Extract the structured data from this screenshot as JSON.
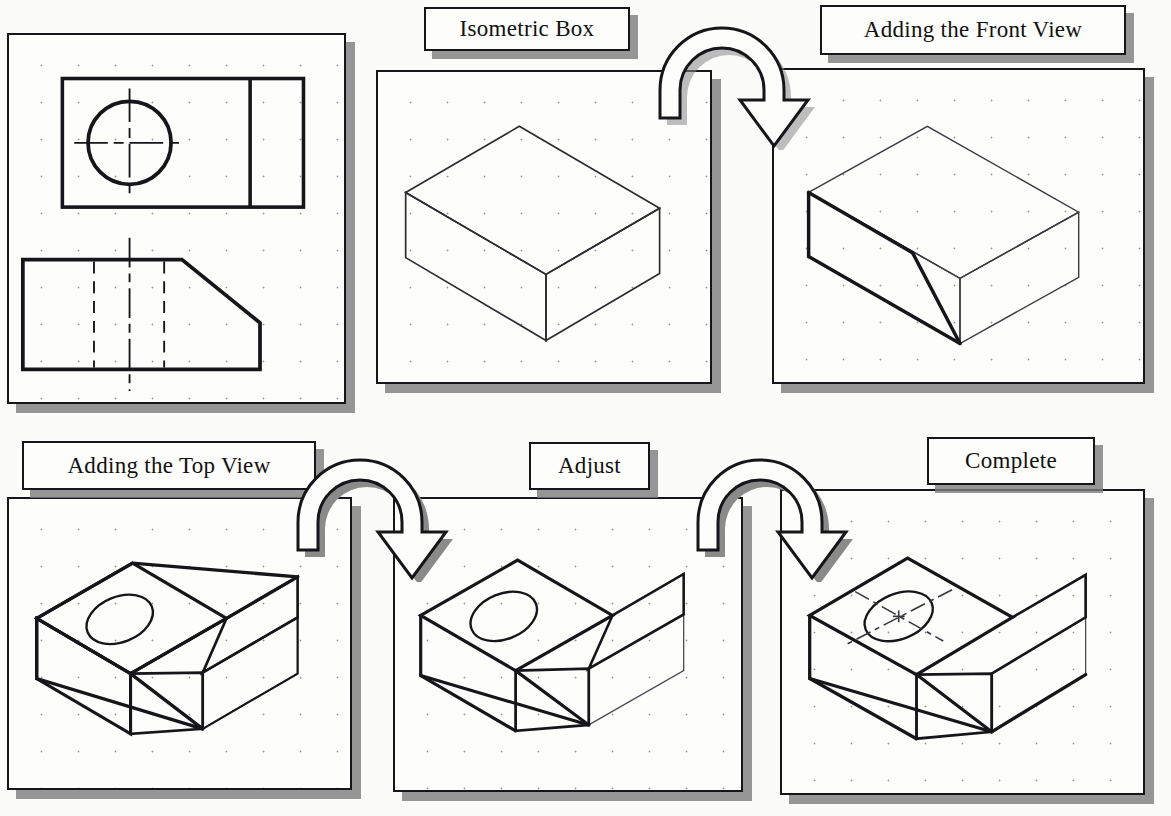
{
  "figure": {
    "kind": "isometric-drawing-tutorial"
  },
  "captions": [
    {
      "id": "isometric-box",
      "text": "Isometric Box",
      "x": 424,
      "y": 7,
      "w": 206,
      "h": 44,
      "font_size": 23
    },
    {
      "id": "front-view",
      "text": "Adding the Front View",
      "x": 820,
      "y": 5,
      "w": 306,
      "h": 50,
      "font_size": 23
    },
    {
      "id": "top-view",
      "text": "Adding the Top View",
      "x": 22,
      "y": 441,
      "w": 294,
      "h": 49,
      "font_size": 23
    },
    {
      "id": "adjust",
      "text": "Adjust",
      "x": 529,
      "y": 442,
      "w": 121,
      "h": 48,
      "font_size": 23
    },
    {
      "id": "complete",
      "text": "Complete",
      "x": 927,
      "y": 437,
      "w": 168,
      "h": 48,
      "font_size": 23
    }
  ],
  "panels": [
    {
      "id": "orthographic-views",
      "label": "Orthographic Views",
      "x": 7,
      "y": 33,
      "w": 339,
      "h": 371
    },
    {
      "id": "isometric-box",
      "label": "Isometric Box",
      "x": 376,
      "y": 70,
      "w": 336,
      "h": 314
    },
    {
      "id": "front-view",
      "label": "Adding the Front View",
      "x": 772,
      "y": 68,
      "w": 373,
      "h": 316
    },
    {
      "id": "top-view",
      "label": "Adding the Top View",
      "x": 7,
      "y": 497,
      "w": 345,
      "h": 293
    },
    {
      "id": "adjust",
      "label": "Adjust",
      "x": 393,
      "y": 497,
      "w": 350,
      "h": 295
    },
    {
      "id": "complete",
      "label": "Complete",
      "x": 780,
      "y": 489,
      "w": 365,
      "h": 306
    }
  ],
  "arrows": [
    {
      "id": "arrow-box-to-front",
      "from": "isometric-box",
      "to": "front-view",
      "x": 652,
      "y": 20,
      "w": 180,
      "h": 130
    },
    {
      "id": "arrow-front-to-top",
      "from": "front-view",
      "to": "top-view",
      "x": 290,
      "y": 452,
      "w": 180,
      "h": 130
    },
    {
      "id": "arrow-top-to-adjust",
      "from": "top-view",
      "to": "adjust",
      "x": 690,
      "y": 452,
      "w": 180,
      "h": 130
    }
  ],
  "drawing_data": {
    "orthographic": {
      "top_view": {
        "shape": "rectangle",
        "divider": "vertical line at right third",
        "feature": "through hole circle with horizontal and vertical centerlines"
      },
      "front_view": {
        "shape": "rectangle with chamfered upper-right corner",
        "hidden_lines": "two vertical dashed lines marking hole walls",
        "centerline": "vertical long-dash centerline through hole"
      }
    },
    "isometric_steps": [
      {
        "step": 1,
        "name": "Isometric Box",
        "adds": "plain isometric rectangular block, light construction lines"
      },
      {
        "step": 2,
        "name": "Adding the Front View",
        "adds": "inclined chamfer face drawn with heavy object lines"
      },
      {
        "step": 3,
        "name": "Adding the Top View",
        "adds": "isometric ellipse representing the hole on the top face"
      },
      {
        "step": 4,
        "name": "Adjust",
        "adds": "trims back surplus construction lines"
      },
      {
        "step": 5,
        "name": "Complete",
        "adds": "isometric centerlines through the hole; final object lines darkened"
      }
    ]
  },
  "colors": {
    "object_line": "#16161a",
    "construction_line": "#4a4a50",
    "paper": "#fdfdfc",
    "shadow": "#7d7d7d"
  }
}
